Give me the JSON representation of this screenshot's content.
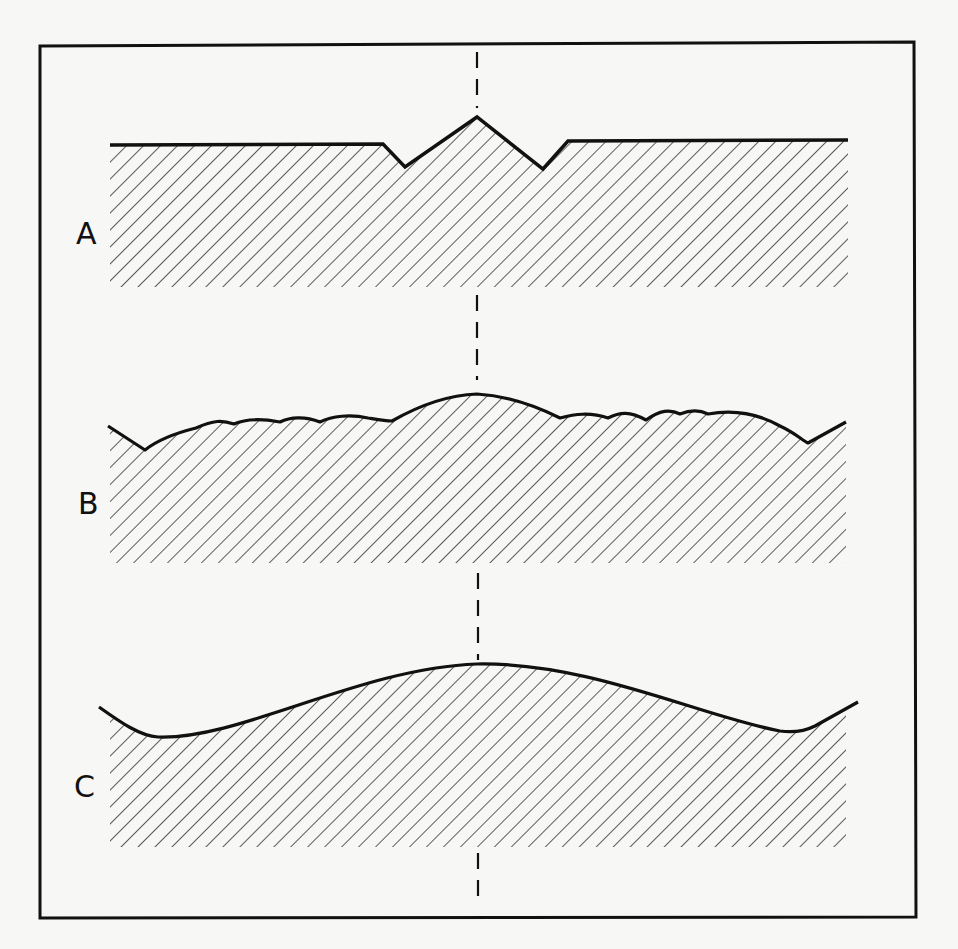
{
  "figure": {
    "colors": {
      "background": "#f7f7f5",
      "ink": "#111111",
      "hatch": "#333333"
    },
    "panels": [
      {
        "label": "A",
        "profile": "flat surface with a sharp V-shaped ridge flanked by two notches at the center"
      },
      {
        "label": "B",
        "profile": "broad rounded hump at center with small superimposed ripples"
      },
      {
        "label": "C",
        "profile": "smooth broad hump, rising at both outer edges"
      }
    ],
    "centerline": {
      "style": "dashed",
      "x": 477
    }
  }
}
